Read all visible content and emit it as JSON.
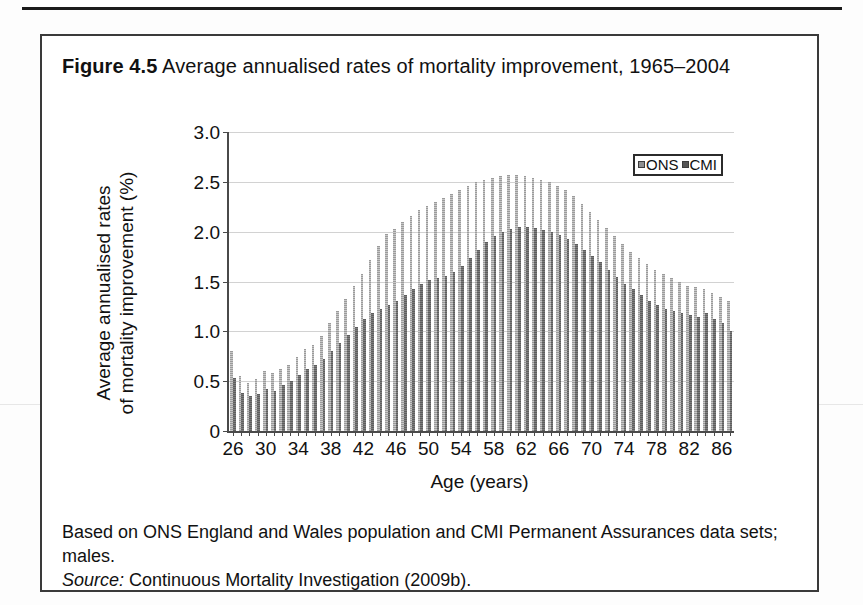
{
  "figure": {
    "title_lead": "Figure 4.5",
    "title_rest": "Average annualised rates of mortality improvement, 1965–2004",
    "caption_line1": "Based on ONS England and Wales population and CMI Permanent Assurances data sets; males.",
    "caption_source_word": "Source:",
    "caption_source_text": "Continuous Mortality Investigation (2009b)."
  },
  "chart_data": {
    "type": "bar",
    "title": "Average annualised rates of mortality improvement, 1965–2004",
    "xlabel": "Age (years)",
    "ylabel": "Average annualised rates of mortality improvement (%)",
    "ylabel_line1": "Average annualised rates",
    "ylabel_line2": "of mortality improvement (%)",
    "ylim": [
      0,
      3.0
    ],
    "ytick_labels": [
      "3.0",
      "2.5",
      "2.0",
      "1.5",
      "1.0",
      "0.5",
      "0"
    ],
    "ytick_values": [
      3.0,
      2.5,
      2.0,
      1.5,
      1.0,
      0.5,
      0
    ],
    "grid": true,
    "legend_position": "top-right",
    "xlim": [
      26,
      87
    ],
    "xtick_labels": [
      "26",
      "30",
      "34",
      "38",
      "42",
      "46",
      "50",
      "54",
      "58",
      "62",
      "66",
      "70",
      "74",
      "78",
      "82",
      "86"
    ],
    "xtick_values": [
      26,
      30,
      34,
      38,
      42,
      46,
      50,
      54,
      58,
      62,
      66,
      70,
      74,
      78,
      82,
      86
    ],
    "categories": [
      26,
      27,
      28,
      29,
      30,
      31,
      32,
      33,
      34,
      35,
      36,
      37,
      38,
      39,
      40,
      41,
      42,
      43,
      44,
      45,
      46,
      47,
      48,
      49,
      50,
      51,
      52,
      53,
      54,
      55,
      56,
      57,
      58,
      59,
      60,
      61,
      62,
      63,
      64,
      65,
      66,
      67,
      68,
      69,
      70,
      71,
      72,
      73,
      74,
      75,
      76,
      77,
      78,
      79,
      80,
      81,
      82,
      83,
      84,
      85,
      86,
      87
    ],
    "series": [
      {
        "name": "ONS",
        "color": "#9b9b9b",
        "values": [
          0.8,
          0.55,
          0.48,
          0.52,
          0.6,
          0.58,
          0.62,
          0.66,
          0.74,
          0.82,
          0.86,
          0.95,
          1.08,
          1.2,
          1.32,
          1.45,
          1.58,
          1.72,
          1.86,
          1.98,
          2.03,
          2.1,
          2.16,
          2.22,
          2.26,
          2.3,
          2.34,
          2.38,
          2.42,
          2.46,
          2.5,
          2.52,
          2.54,
          2.56,
          2.57,
          2.57,
          2.56,
          2.54,
          2.52,
          2.5,
          2.46,
          2.42,
          2.36,
          2.28,
          2.2,
          2.12,
          2.04,
          1.96,
          1.88,
          1.8,
          1.74,
          1.68,
          1.62,
          1.58,
          1.54,
          1.5,
          1.46,
          1.44,
          1.42,
          1.38,
          1.34,
          1.3
        ]
      },
      {
        "name": "CMI",
        "color": "#5e5e5e",
        "values": [
          0.53,
          0.38,
          0.35,
          0.37,
          0.42,
          0.4,
          0.46,
          0.5,
          0.56,
          0.62,
          0.66,
          0.72,
          0.8,
          0.88,
          0.96,
          1.04,
          1.12,
          1.18,
          1.22,
          1.26,
          1.3,
          1.36,
          1.42,
          1.48,
          1.52,
          1.54,
          1.56,
          1.6,
          1.66,
          1.74,
          1.82,
          1.9,
          1.96,
          2.0,
          2.03,
          2.05,
          2.05,
          2.04,
          2.02,
          2.0,
          1.97,
          1.93,
          1.88,
          1.82,
          1.76,
          1.7,
          1.62,
          1.55,
          1.48,
          1.42,
          1.36,
          1.3,
          1.26,
          1.22,
          1.2,
          1.18,
          1.16,
          1.14,
          1.18,
          1.12,
          1.08,
          1.0
        ]
      }
    ]
  },
  "legend": {
    "items": [
      {
        "label": "ONS"
      },
      {
        "label": "CMI"
      }
    ]
  }
}
